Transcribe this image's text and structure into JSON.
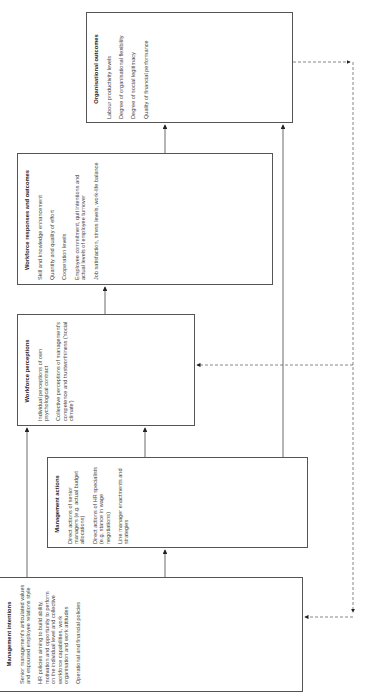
{
  "boxes": {
    "intentions": {
      "title": "Management intentions",
      "items": [
        "Senior management's articulated values and espoused employee relations style",
        "HR policies aiming to build ability, motivation and opportunity to perform on the individual level and collective workforce capabilities, work organisation and work attitudes",
        "Operational and financial policies"
      ]
    },
    "actions": {
      "title": "Management actions",
      "items": [
        "Direct actions of senior managers (e.g. actual budget allocations)",
        "Direct actions of HR specialists (e.g. stance in wage negotiations)",
        "Line manager enactments and strategies"
      ]
    },
    "perceptions": {
      "title": "Workforce perceptions",
      "items": [
        "Individual perceptions of own psychological contract",
        "Collective perceptions of management's competence and trustworthiness ('social climate')"
      ]
    },
    "responses": {
      "title": "Workforce responses and outcomes",
      "items": [
        "Skill and knowledge enhancement",
        "Quantity and quality of effort",
        "Cooperation levels",
        "Employee commitment, quit intentions and actual levels of employee turnover",
        "Job satisfaction, stress levels, work-life balance"
      ]
    },
    "outcomes": {
      "title": "Organisational outcomes",
      "items": [
        "Labour productivity levels",
        "Degree of organisational flexibility",
        "Degree of social legitimacy",
        "Quality of financial performance"
      ]
    }
  },
  "colors": {
    "line": "#444444",
    "dashed": "#555555",
    "border": "#555555"
  }
}
